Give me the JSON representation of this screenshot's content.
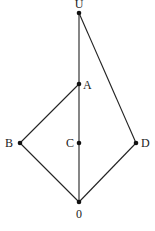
{
  "diagram": {
    "type": "hasse-diagram",
    "width": 155,
    "height": 231,
    "nodes": [
      {
        "id": "U",
        "label": "U",
        "x": 79,
        "y": 13,
        "label_x": 79,
        "label_y": 8,
        "anchor": "middle"
      },
      {
        "id": "A",
        "label": "A",
        "x": 79,
        "y": 84,
        "label_x": 83,
        "label_y": 89,
        "anchor": "start"
      },
      {
        "id": "B",
        "label": "B",
        "x": 20,
        "y": 143,
        "label_x": 13,
        "label_y": 147,
        "anchor": "end"
      },
      {
        "id": "C",
        "label": "C",
        "x": 79,
        "y": 143,
        "label_x": 74,
        "label_y": 147,
        "anchor": "end"
      },
      {
        "id": "D",
        "label": "D",
        "x": 136,
        "y": 143,
        "label_x": 141,
        "label_y": 147,
        "anchor": "start"
      },
      {
        "id": "O",
        "label": "0",
        "x": 79,
        "y": 202,
        "label_x": 79,
        "label_y": 218,
        "anchor": "middle"
      }
    ],
    "edges": [
      {
        "from": "U",
        "to": "A"
      },
      {
        "from": "A",
        "to": "C"
      },
      {
        "from": "C",
        "to": "O"
      },
      {
        "from": "A",
        "to": "B"
      },
      {
        "from": "B",
        "to": "O"
      },
      {
        "from": "U",
        "to": "D"
      },
      {
        "from": "D",
        "to": "O"
      }
    ]
  }
}
